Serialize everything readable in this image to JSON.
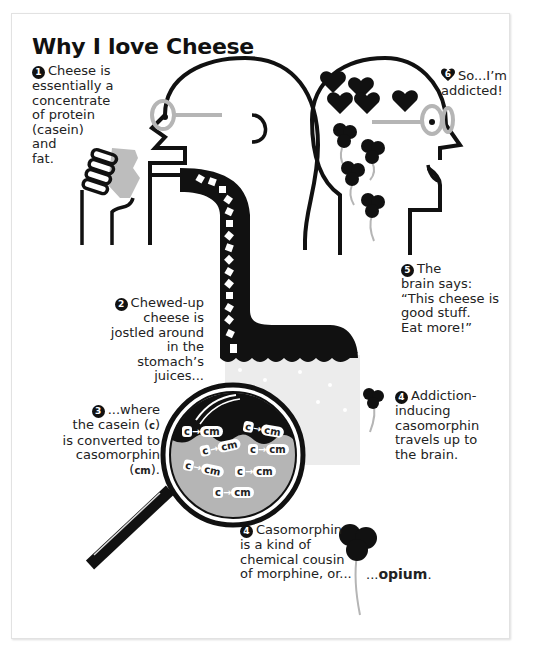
{
  "title": "Why I love Cheese",
  "steps": {
    "step1": {
      "number": "1",
      "lines": [
        "Cheese is",
        "essentially a",
        "concentrate",
        "of protein",
        "(casein)",
        "and",
        "fat."
      ]
    },
    "step2": {
      "number": "2",
      "lines": [
        "Chewed-up",
        "cheese is",
        "jostled around",
        "in the stomach’s",
        "juices..."
      ]
    },
    "step3": {
      "number": "3",
      "line1": "...where",
      "line2_pre": "the casein (",
      "line2_sym": "c",
      "line2_post": ")",
      "line3": "is converted to",
      "line4": "casomorphin",
      "line5_pre": "(",
      "line5_sym": "cm",
      "line5_post": ")."
    },
    "step4a": {
      "number": "4",
      "lines": [
        "Addiction-",
        "inducing",
        "casomorphin",
        "travels up to",
        "the brain."
      ]
    },
    "step4b": {
      "number": "4",
      "lines": [
        "Casomorphin",
        "is a kind of",
        "chemical cousin",
        "of morphine, or..."
      ],
      "opium_prefix": "...",
      "opium": "opium",
      "opium_suffix": "."
    },
    "step5": {
      "number": "5",
      "lines": [
        "The",
        "brain says:",
        "“This cheese is",
        "good stuff.",
        "Eat more!”"
      ]
    },
    "step6": {
      "number": "6",
      "lines": [
        "So...I’m",
        "addicted!"
      ]
    }
  },
  "magnifier": {
    "labels": [
      {
        "c": "c",
        "arrow": "→",
        "cm": "cm"
      },
      {
        "c": "c",
        "arrow": "→",
        "cm": "cm"
      },
      {
        "c": "c",
        "arrow": "→",
        "cm": "cm"
      },
      {
        "c": "c",
        "arrow": "→",
        "cm": "cm"
      },
      {
        "c": "c",
        "arrow": "→",
        "cm": "cm"
      },
      {
        "c": "c",
        "arrow": "→",
        "cm": "cm"
      },
      {
        "c": "c",
        "arrow": "→",
        "cm": "cm"
      }
    ]
  },
  "colors": {
    "ink": "#111111",
    "gray": "#b5b5b5",
    "light": "#ececec",
    "paper": "#ffffff"
  }
}
